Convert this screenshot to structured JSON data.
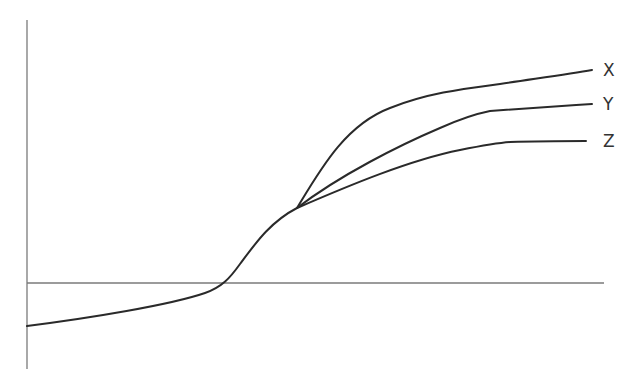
{
  "diagram": {
    "type": "curve-divergence",
    "curves": [
      {
        "name": "X",
        "label": "X"
      },
      {
        "name": "Y",
        "label": "Y"
      },
      {
        "name": "Z",
        "label": "Z"
      }
    ],
    "labels": {
      "x": "X",
      "y": "Y",
      "z": "Z"
    },
    "colors": {
      "axis": "#7a7a7a",
      "curve": "#2a2a2a",
      "background": "#ffffff"
    }
  }
}
